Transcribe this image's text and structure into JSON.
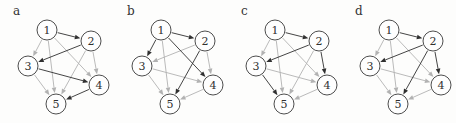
{
  "figure": {
    "background": "#fdfdfc",
    "colors": {
      "dark_edge": "#303030",
      "light_edge": "#b2b2b2",
      "node_fill": "#fefefe",
      "node_stroke": "#4d4d4d",
      "node_text": "#303030",
      "label_text": "#333333"
    },
    "node_radius": 10,
    "nodes": [
      {
        "id": "1",
        "x": 47,
        "y": 30
      },
      {
        "id": "2",
        "x": 91,
        "y": 41
      },
      {
        "id": "3",
        "x": 28,
        "y": 66
      },
      {
        "id": "4",
        "x": 99,
        "y": 85
      },
      {
        "id": "5",
        "x": 56,
        "y": 104
      }
    ],
    "panels": [
      {
        "id": "a",
        "label": "a",
        "edges": [
          {
            "from": "1",
            "to": "2",
            "tone": "dark"
          },
          {
            "from": "1",
            "to": "3",
            "tone": "light"
          },
          {
            "from": "1",
            "to": "4",
            "tone": "light"
          },
          {
            "from": "1",
            "to": "5",
            "tone": "light"
          },
          {
            "from": "2",
            "to": "3",
            "tone": "dark"
          },
          {
            "from": "2",
            "to": "4",
            "tone": "light"
          },
          {
            "from": "2",
            "to": "5",
            "tone": "light"
          },
          {
            "from": "3",
            "to": "4",
            "tone": "dark"
          },
          {
            "from": "3",
            "to": "5",
            "tone": "light"
          },
          {
            "from": "4",
            "to": "5",
            "tone": "dark"
          }
        ]
      },
      {
        "id": "b",
        "label": "b",
        "edges": [
          {
            "from": "1",
            "to": "2",
            "tone": "dark"
          },
          {
            "from": "1",
            "to": "3",
            "tone": "dark"
          },
          {
            "from": "1",
            "to": "4",
            "tone": "dark"
          },
          {
            "from": "1",
            "to": "5",
            "tone": "light"
          },
          {
            "from": "2",
            "to": "3",
            "tone": "light"
          },
          {
            "from": "2",
            "to": "4",
            "tone": "light"
          },
          {
            "from": "2",
            "to": "5",
            "tone": "dark"
          },
          {
            "from": "3",
            "to": "4",
            "tone": "light"
          },
          {
            "from": "3",
            "to": "5",
            "tone": "light"
          },
          {
            "from": "4",
            "to": "5",
            "tone": "light"
          }
        ]
      },
      {
        "id": "c",
        "label": "c",
        "edges": [
          {
            "from": "1",
            "to": "2",
            "tone": "dark"
          },
          {
            "from": "1",
            "to": "3",
            "tone": "light"
          },
          {
            "from": "1",
            "to": "4",
            "tone": "light"
          },
          {
            "from": "1",
            "to": "5",
            "tone": "light"
          },
          {
            "from": "2",
            "to": "3",
            "tone": "dark"
          },
          {
            "from": "2",
            "to": "4",
            "tone": "dark"
          },
          {
            "from": "2",
            "to": "5",
            "tone": "light"
          },
          {
            "from": "3",
            "to": "4",
            "tone": "light"
          },
          {
            "from": "3",
            "to": "5",
            "tone": "dark"
          },
          {
            "from": "4",
            "to": "5",
            "tone": "light"
          }
        ]
      },
      {
        "id": "d",
        "label": "d",
        "edges": [
          {
            "from": "1",
            "to": "2",
            "tone": "dark"
          },
          {
            "from": "1",
            "to": "3",
            "tone": "light"
          },
          {
            "from": "1",
            "to": "4",
            "tone": "light"
          },
          {
            "from": "1",
            "to": "5",
            "tone": "light"
          },
          {
            "from": "2",
            "to": "3",
            "tone": "dark"
          },
          {
            "from": "2",
            "to": "4",
            "tone": "dark"
          },
          {
            "from": "2",
            "to": "5",
            "tone": "dark"
          },
          {
            "from": "3",
            "to": "4",
            "tone": "light"
          },
          {
            "from": "3",
            "to": "5",
            "tone": "light"
          },
          {
            "from": "4",
            "to": "5",
            "tone": "light"
          }
        ]
      }
    ]
  }
}
